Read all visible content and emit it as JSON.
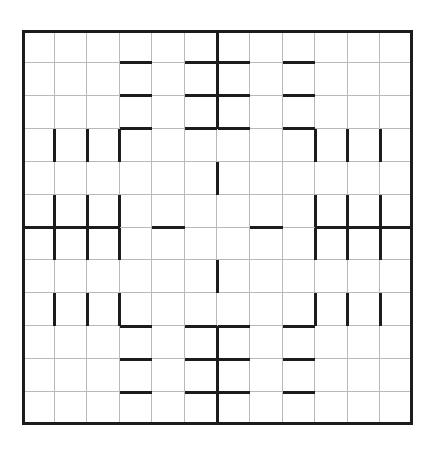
{
  "page": {
    "width": 435,
    "height": 450,
    "background_color": "#ffffff"
  },
  "puzzle": {
    "type": "wall-grid-puzzle",
    "title": "",
    "grid": {
      "columns": 12,
      "rows": 12,
      "origin_x": 22,
      "origin_y": 30,
      "width": 391,
      "height": 395,
      "cell_width": 32.58,
      "cell_height": 32.92,
      "thin_line_color": "#b9b9b9",
      "thin_line_width": 1,
      "thick_line_color": "#1c1c1c",
      "thick_line_width": 3,
      "outer_border_width": 3,
      "outer_border_color": "#1c1c1c",
      "cell_fill_color": "#ffffff"
    },
    "walls": {
      "horizontal": [
        {
          "row": 1,
          "col": 4
        },
        {
          "row": 1,
          "col": 6
        },
        {
          "row": 1,
          "col": 7
        },
        {
          "row": 1,
          "col": 9
        },
        {
          "row": 2,
          "col": 4
        },
        {
          "row": 2,
          "col": 6
        },
        {
          "row": 2,
          "col": 7
        },
        {
          "row": 2,
          "col": 9
        },
        {
          "row": 3,
          "col": 4
        },
        {
          "row": 3,
          "col": 6
        },
        {
          "row": 3,
          "col": 7
        },
        {
          "row": 3,
          "col": 9
        },
        {
          "row": 6,
          "col": 1
        },
        {
          "row": 6,
          "col": 2
        },
        {
          "row": 6,
          "col": 3
        },
        {
          "row": 6,
          "col": 5
        },
        {
          "row": 6,
          "col": 8
        },
        {
          "row": 6,
          "col": 10
        },
        {
          "row": 6,
          "col": 11
        },
        {
          "row": 6,
          "col": 12
        },
        {
          "row": 9,
          "col": 4
        },
        {
          "row": 9,
          "col": 6
        },
        {
          "row": 9,
          "col": 7
        },
        {
          "row": 9,
          "col": 9
        },
        {
          "row": 10,
          "col": 4
        },
        {
          "row": 10,
          "col": 6
        },
        {
          "row": 10,
          "col": 7
        },
        {
          "row": 10,
          "col": 9
        },
        {
          "row": 11,
          "col": 4
        },
        {
          "row": 11,
          "col": 6
        },
        {
          "row": 11,
          "col": 7
        },
        {
          "row": 11,
          "col": 9
        }
      ],
      "vertical": [
        {
          "row": 1,
          "col": 6
        },
        {
          "row": 2,
          "col": 6
        },
        {
          "row": 3,
          "col": 6
        },
        {
          "row": 4,
          "col": 1
        },
        {
          "row": 4,
          "col": 2
        },
        {
          "row": 4,
          "col": 3
        },
        {
          "row": 4,
          "col": 9
        },
        {
          "row": 4,
          "col": 10
        },
        {
          "row": 4,
          "col": 11
        },
        {
          "row": 5,
          "col": 6
        },
        {
          "row": 6,
          "col": 1
        },
        {
          "row": 6,
          "col": 2
        },
        {
          "row": 6,
          "col": 3
        },
        {
          "row": 6,
          "col": 9
        },
        {
          "row": 6,
          "col": 10
        },
        {
          "row": 6,
          "col": 11
        },
        {
          "row": 7,
          "col": 1
        },
        {
          "row": 7,
          "col": 2
        },
        {
          "row": 7,
          "col": 3
        },
        {
          "row": 7,
          "col": 9
        },
        {
          "row": 7,
          "col": 10
        },
        {
          "row": 7,
          "col": 11
        },
        {
          "row": 8,
          "col": 6
        },
        {
          "row": 9,
          "col": 1
        },
        {
          "row": 9,
          "col": 2
        },
        {
          "row": 9,
          "col": 3
        },
        {
          "row": 9,
          "col": 9
        },
        {
          "row": 9,
          "col": 10
        },
        {
          "row": 9,
          "col": 11
        },
        {
          "row": 10,
          "col": 6
        },
        {
          "row": 11,
          "col": 6
        },
        {
          "row": 12,
          "col": 6
        }
      ]
    }
  }
}
